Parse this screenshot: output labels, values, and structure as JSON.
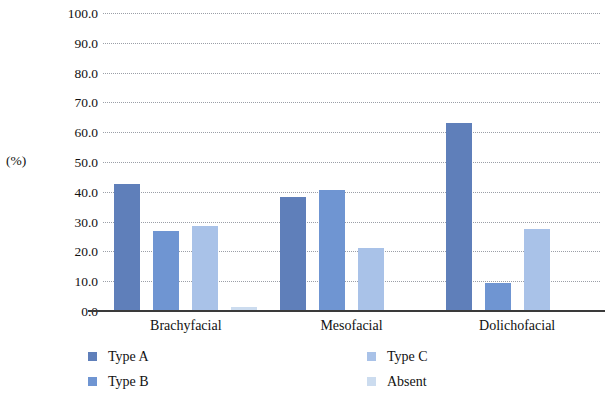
{
  "chart_data": {
    "type": "bar",
    "title": "",
    "xlabel": "",
    "ylabel": "(%)",
    "ylim": [
      0,
      100
    ],
    "ytick_step": 10,
    "ytick_labels": [
      "0.0",
      "10.0",
      "20.0",
      "30.0",
      "40.0",
      "50.0",
      "60.0",
      "70.0",
      "80.0",
      "90.0",
      "100.0"
    ],
    "grid": true,
    "grid_style": "dotted-horizontal",
    "legend_position": "bottom",
    "legend_columns": 2,
    "categories": [
      "Brachyfacial",
      "Mesofacial",
      "Dolichofacial"
    ],
    "series": [
      {
        "name": "Type A",
        "color": "#5f7fba",
        "values": [
          42.5,
          38.3,
          63.0
        ]
      },
      {
        "name": "Type B",
        "color": "#6f95d2",
        "values": [
          26.8,
          40.7,
          9.4
        ]
      },
      {
        "name": "Type C",
        "color": "#a9c2e8",
        "values": [
          28.6,
          21.1,
          27.6
        ]
      },
      {
        "name": "Absent",
        "color": "#ccdcef",
        "values": [
          1.4,
          0.0,
          0.0
        ]
      }
    ]
  },
  "axis": {
    "y_title": "(%)"
  },
  "colors": {
    "axis_line": "#3a3a3a",
    "gridline": "#8a8f98",
    "background": "#ffffff",
    "text": "#111111"
  }
}
